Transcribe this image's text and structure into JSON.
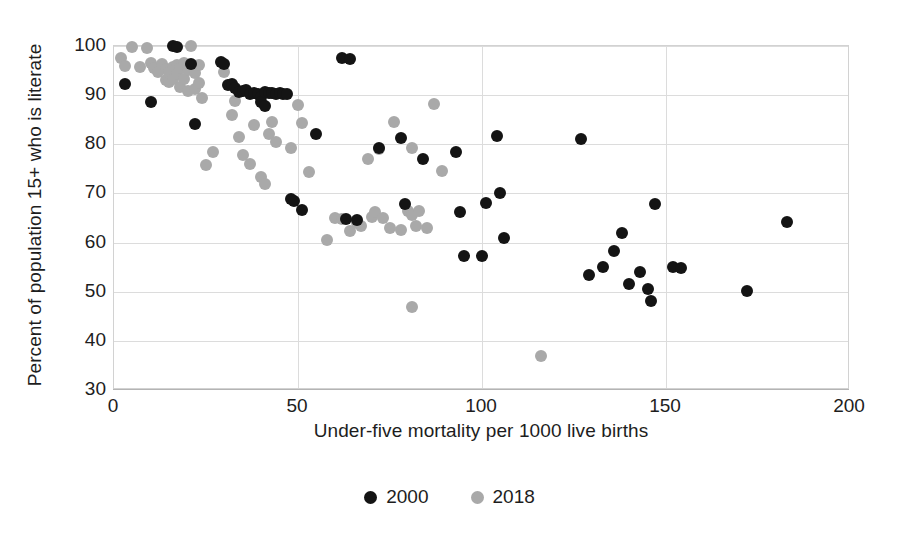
{
  "chart_data": {
    "type": "scatter",
    "title": "",
    "xlabel": "Under-five mortality per 1000 live births",
    "ylabel": "Percent of population 15+ who is literate",
    "xlim": [
      0,
      200
    ],
    "ylim": [
      30,
      100
    ],
    "xticks": [
      0,
      50,
      100,
      150,
      200
    ],
    "yticks": [
      30,
      40,
      50,
      60,
      70,
      80,
      90,
      100
    ],
    "grid": true,
    "legend_position": "bottom-center",
    "series": [
      {
        "name": "2000",
        "color": "#141414",
        "points": [
          [
            3,
            92.2
          ],
          [
            10,
            88.6
          ],
          [
            16,
            100.0
          ],
          [
            17,
            99.8
          ],
          [
            21,
            96.3
          ],
          [
            22,
            84.2
          ],
          [
            29,
            96.8
          ],
          [
            30,
            96.3
          ],
          [
            31,
            92.0
          ],
          [
            32,
            92.2
          ],
          [
            33,
            91.5
          ],
          [
            34,
            90.7
          ],
          [
            35,
            90.9
          ],
          [
            36,
            91.0
          ],
          [
            37,
            90.3
          ],
          [
            38,
            90.5
          ],
          [
            39,
            90.2
          ],
          [
            40,
            89.7
          ],
          [
            40,
            88.6
          ],
          [
            41,
            87.7
          ],
          [
            41,
            90.6
          ],
          [
            42,
            90.4
          ],
          [
            43,
            90.5
          ],
          [
            44,
            90.3
          ],
          [
            45,
            90.5
          ],
          [
            46,
            90.2
          ],
          [
            47,
            90.3
          ],
          [
            48,
            68.8
          ],
          [
            49,
            68.4
          ],
          [
            51,
            66.7
          ],
          [
            55,
            82.0
          ],
          [
            62,
            97.6
          ],
          [
            64,
            97.4
          ],
          [
            63,
            64.8
          ],
          [
            66,
            64.5
          ],
          [
            72,
            79.2
          ],
          [
            78,
            81.2
          ],
          [
            79,
            67.9
          ],
          [
            84,
            77.0
          ],
          [
            93,
            78.4
          ],
          [
            94,
            66.3
          ],
          [
            95,
            57.2
          ],
          [
            100,
            57.3
          ],
          [
            101,
            68.0
          ],
          [
            105,
            70.1
          ],
          [
            106,
            61.0
          ],
          [
            104,
            81.7
          ],
          [
            127,
            81.0
          ],
          [
            129,
            53.3
          ],
          [
            133,
            55.0
          ],
          [
            136,
            58.3
          ],
          [
            138,
            62.0
          ],
          [
            140,
            51.5
          ],
          [
            143,
            54.0
          ],
          [
            145,
            50.6
          ],
          [
            146,
            48.2
          ],
          [
            147,
            67.9
          ],
          [
            152,
            55.0
          ],
          [
            154,
            54.8
          ],
          [
            172,
            50.1
          ],
          [
            183,
            64.1
          ]
        ]
      },
      {
        "name": "2018",
        "color": "#a9a9a9",
        "points": [
          [
            2,
            97.6
          ],
          [
            3,
            95.9
          ],
          [
            5,
            99.8
          ],
          [
            7,
            95.7
          ],
          [
            9,
            99.6
          ],
          [
            10,
            96.6
          ],
          [
            11,
            95.5
          ],
          [
            12,
            94.7
          ],
          [
            13,
            96.3
          ],
          [
            14,
            95.4
          ],
          [
            14,
            93.0
          ],
          [
            15,
            94.8
          ],
          [
            15,
            92.6
          ],
          [
            16,
            95.8
          ],
          [
            16,
            93.3
          ],
          [
            17,
            96.1
          ],
          [
            17,
            94.4
          ],
          [
            18,
            95.5
          ],
          [
            18,
            91.6
          ],
          [
            19,
            96.6
          ],
          [
            19,
            93.2
          ],
          [
            20,
            95.2
          ],
          [
            20,
            90.9
          ],
          [
            21,
            100.0
          ],
          [
            21,
            95.6
          ],
          [
            22,
            94.6
          ],
          [
            22,
            91.3
          ],
          [
            23,
            96.1
          ],
          [
            23,
            92.4
          ],
          [
            24,
            89.4
          ],
          [
            25,
            75.7
          ],
          [
            27,
            78.5
          ],
          [
            30,
            94.7
          ],
          [
            32,
            86.0
          ],
          [
            33,
            88.9
          ],
          [
            34,
            81.5
          ],
          [
            35,
            77.8
          ],
          [
            37,
            76.0
          ],
          [
            38,
            84.0
          ],
          [
            40,
            73.4
          ],
          [
            41,
            72.0
          ],
          [
            42,
            82.1
          ],
          [
            43,
            84.5
          ],
          [
            44,
            80.5
          ],
          [
            48,
            79.3
          ],
          [
            50,
            88.0
          ],
          [
            51,
            84.4
          ],
          [
            53,
            74.3
          ],
          [
            58,
            60.5
          ],
          [
            60,
            65.0
          ],
          [
            62,
            64.8
          ],
          [
            64,
            62.3
          ],
          [
            66,
            64.0
          ],
          [
            67,
            63.4
          ],
          [
            70,
            65.3
          ],
          [
            71,
            66.2
          ],
          [
            73,
            65.0
          ],
          [
            75,
            63.0
          ],
          [
            78,
            62.5
          ],
          [
            80,
            66.4
          ],
          [
            81,
            65.6
          ],
          [
            82,
            63.4
          ],
          [
            83,
            66.5
          ],
          [
            85,
            63.0
          ],
          [
            81,
            46.8
          ],
          [
            116,
            37.0
          ],
          [
            81,
            79.3
          ],
          [
            87,
            88.1
          ],
          [
            89,
            74.5
          ],
          [
            76,
            84.5
          ],
          [
            72,
            79.0
          ],
          [
            69,
            77.0
          ]
        ]
      }
    ]
  },
  "legend": {
    "items": [
      {
        "label": "2000",
        "color": "#141414"
      },
      {
        "label": "2018",
        "color": "#a9a9a9"
      }
    ]
  }
}
